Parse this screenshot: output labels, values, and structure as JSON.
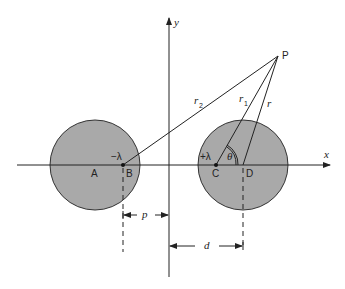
{
  "diagram": {
    "axes": {
      "x_label": "x",
      "y_label": "y"
    },
    "points": {
      "A": "A",
      "B": "B",
      "C": "C",
      "D": "D",
      "P": "P"
    },
    "charges": {
      "negative": "−λ",
      "positive": "+λ"
    },
    "distances": {
      "r": "r",
      "r1": "r",
      "r1_sub": "1",
      "r2": "r",
      "r2_sub": "2",
      "theta": "θ"
    },
    "dimensions": {
      "p": "p",
      "d": "d"
    },
    "colors": {
      "circle_fill": "#a9a9a9",
      "line": "#222222",
      "background": "#ffffff"
    }
  }
}
